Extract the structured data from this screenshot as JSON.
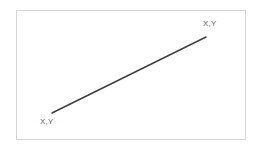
{
  "diagram": {
    "background_color": "#ffffff",
    "frame": {
      "name": "diagram-frame",
      "border_color": "#d6d6d8",
      "fill_color": "#ffffff",
      "x": 16,
      "y": 10,
      "width": 230,
      "height": 130
    },
    "segment": {
      "name": "diagonal-line-segment",
      "stroke_color": "#3d3d42",
      "stroke_width": 1.4,
      "start": {
        "x": 52,
        "y": 113
      },
      "end": {
        "x": 206,
        "y": 37
      }
    },
    "labels": [
      {
        "name": "endpoint-label-start",
        "text": "X,Y",
        "color": "#5f5f63",
        "x": 40,
        "y": 117
      },
      {
        "name": "endpoint-label-end",
        "text": "X,Y",
        "color": "#5f5f63",
        "x": 203,
        "y": 19
      }
    ]
  }
}
